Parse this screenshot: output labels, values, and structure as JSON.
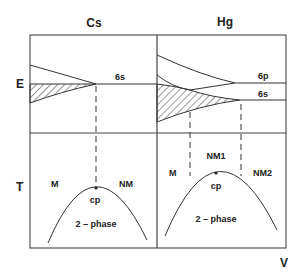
{
  "panels": {
    "cs": {
      "title": "Cs",
      "level": "6s",
      "regions": {
        "left": "M",
        "right": "NM",
        "critical": "cp",
        "dome": "2 – phase"
      }
    },
    "hg": {
      "title": "Hg",
      "levels": [
        "6p",
        "6s"
      ],
      "regions": {
        "left": "M",
        "middle": "NM1",
        "right": "NM2",
        "critical": "cp",
        "dome": "2 – phase"
      }
    }
  },
  "axes": {
    "energy": "E",
    "temperature": "T",
    "volume": "V"
  },
  "colors": {
    "line": "#333333",
    "background": "#ffffff"
  }
}
